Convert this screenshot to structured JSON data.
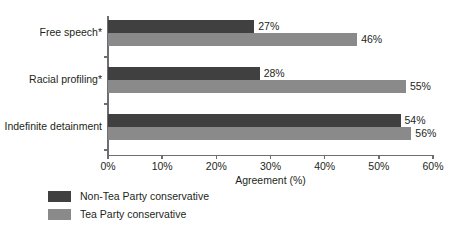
{
  "chart_data": {
    "type": "bar",
    "orientation": "horizontal",
    "title": "",
    "xlabel": "Agreement (%)",
    "ylabel": "",
    "xlim": [
      0,
      60
    ],
    "grid": false,
    "legend_position": "bottom-left",
    "categories": [
      "Free speech*",
      "Racial profiling*",
      "Indefinite detainment"
    ],
    "xticks": [
      "0%",
      "10%",
      "20%",
      "30%",
      "40%",
      "50%",
      "60%"
    ],
    "xtick_values": [
      0,
      10,
      20,
      30,
      40,
      50,
      60
    ],
    "series": [
      {
        "name": "Non-Tea Party conservative",
        "color": "#404040",
        "values": [
          27,
          28,
          54
        ],
        "labels": [
          "27%",
          "28%",
          "54%"
        ]
      },
      {
        "name": "Tea Party conservative",
        "color": "#8a8a8a",
        "values": [
          46,
          55,
          56
        ],
        "labels": [
          "46%",
          "55%",
          "56%"
        ]
      }
    ]
  },
  "legend": {
    "items": [
      {
        "label": "Non-Tea Party conservative",
        "color": "#404040"
      },
      {
        "label": "Tea Party conservative",
        "color": "#8a8a8a"
      }
    ]
  },
  "axis": {
    "x_title": "Agreement (%)"
  }
}
